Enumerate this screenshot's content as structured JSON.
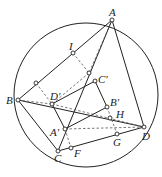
{
  "diagram": {
    "title": "",
    "labels": {
      "A": "A",
      "I": "I",
      "Cp": "C'",
      "B": "B",
      "Dp": "D'",
      "Bp": "B'",
      "H": "H",
      "Ap": "A'",
      "D": "D",
      "G": "G",
      "C": "C",
      "F": "F"
    }
  }
}
